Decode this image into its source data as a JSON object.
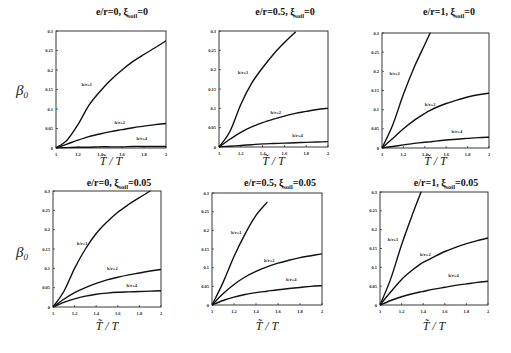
{
  "figure": {
    "y_axis_label": "β",
    "y_axis_label_sub": "0",
    "x_axis_label": "T̃ / T"
  },
  "chart_data": [
    {
      "type": "line",
      "title": "e/r=0, ξsoil=0",
      "title_parts": {
        "prefix": "e/r=0, ξ",
        "sub": "soil",
        "suffix": "=0"
      },
      "xlabel": "T̃ / T",
      "ylabel": "β0",
      "xlim": [
        1,
        2
      ],
      "ylim": [
        0,
        0.3
      ],
      "xticks": [
        "1",
        "1.2",
        "1.4",
        "1.6",
        "1.8",
        "2"
      ],
      "yticks": [
        "0",
        "0.05",
        "0.1",
        "0.15",
        "0.2",
        "0.25",
        "0.3"
      ],
      "grid": false,
      "x": [
        1,
        1.1,
        1.2,
        1.3,
        1.4,
        1.5,
        1.6,
        1.7,
        1.8,
        1.9,
        2
      ],
      "series": [
        {
          "name": "h/r=1",
          "label_at": [
            1.28,
            0.16
          ],
          "values": [
            0,
            0.02,
            0.06,
            0.11,
            0.145,
            0.175,
            0.2,
            0.222,
            0.24,
            0.257,
            0.275
          ]
        },
        {
          "name": "h/r=2",
          "label_at": [
            1.58,
            0.062
          ],
          "values": [
            0,
            0.01,
            0.02,
            0.029,
            0.036,
            0.042,
            0.047,
            0.052,
            0.056,
            0.06,
            0.063
          ]
        },
        {
          "name": "h/r=4",
          "label_at": [
            1.78,
            0.02
          ],
          "values": [
            0,
            0.001,
            0.002,
            0.002,
            0.003,
            0.003,
            0.003,
            0.004,
            0.004,
            0.004,
            0.004
          ]
        }
      ]
    },
    {
      "type": "line",
      "title": "e/r=0.5, ξsoil=0",
      "title_parts": {
        "prefix": "e/r=0.5, ξ",
        "sub": "soil",
        "suffix": "=0"
      },
      "xlabel": "T̃ / T",
      "ylabel": "",
      "xlim": [
        1,
        2
      ],
      "ylim": [
        0,
        0.3
      ],
      "xticks": [
        "1",
        "1.2",
        "1.4",
        "1.6",
        "1.8",
        "2"
      ],
      "yticks": [
        "0",
        "0.05",
        "0.1",
        "0.15",
        "0.2",
        "0.25",
        "0.3"
      ],
      "grid": false,
      "x": [
        1,
        1.1,
        1.2,
        1.3,
        1.4,
        1.5,
        1.6,
        1.7,
        1.8,
        1.9,
        2
      ],
      "series": [
        {
          "name": "h/r=1",
          "label_at": [
            1.22,
            0.19
          ],
          "values": [
            0,
            0.04,
            0.11,
            0.165,
            0.205,
            0.24,
            0.27,
            0.297,
            0.3,
            0.3,
            0.3
          ],
          "x_clip": 1.72
        },
        {
          "name": "h/r=2",
          "label_at": [
            1.52,
            0.085
          ],
          "values": [
            0,
            0.02,
            0.038,
            0.052,
            0.063,
            0.072,
            0.08,
            0.087,
            0.092,
            0.097,
            0.1
          ]
        },
        {
          "name": "h/r=4",
          "label_at": [
            1.72,
            0.025
          ],
          "values": [
            0,
            0.002,
            0.004,
            0.006,
            0.008,
            0.009,
            0.01,
            0.011,
            0.012,
            0.013,
            0.014
          ]
        }
      ]
    },
    {
      "type": "line",
      "title": "e/r=1, ξsoil=0",
      "title_parts": {
        "prefix": "e/r=1, ξ",
        "sub": "soil",
        "suffix": "=0"
      },
      "xlabel": "T̃ / T",
      "ylabel": "",
      "xlim": [
        1,
        2
      ],
      "ylim": [
        0,
        0.3
      ],
      "xticks": [
        "1",
        "1.2",
        "1.4",
        "1.6",
        "1.8",
        "2"
      ],
      "yticks": [
        "0",
        "0.05",
        "0.1",
        "0.15",
        "0.2",
        "0.25",
        "0.3"
      ],
      "grid": false,
      "x": [
        1,
        1.1,
        1.2,
        1.3,
        1.4,
        1.45,
        1.5,
        1.6,
        1.7,
        1.8,
        1.9,
        2
      ],
      "series": [
        {
          "name": "h/r=1",
          "label_at": [
            1.12,
            0.19
          ],
          "values": [
            0,
            0.06,
            0.14,
            0.21,
            0.27,
            0.3,
            0.3,
            0.3,
            0.3,
            0.3,
            0.3,
            0.3
          ],
          "x_clip": 1.45
        },
        {
          "name": "h/r=2",
          "label_at": [
            1.45,
            0.11
          ],
          "values": [
            0,
            0.025,
            0.05,
            0.072,
            0.09,
            0.098,
            0.105,
            0.116,
            0.125,
            0.133,
            0.139,
            0.143
          ]
        },
        {
          "name": "h/r=4",
          "label_at": [
            1.7,
            0.04
          ],
          "values": [
            0,
            0.004,
            0.008,
            0.012,
            0.015,
            0.016,
            0.018,
            0.021,
            0.023,
            0.025,
            0.027,
            0.028
          ]
        }
      ]
    },
    {
      "type": "line",
      "title": "e/r=0, ξsoil=0.05",
      "title_parts": {
        "prefix": "e/r=0, ξ",
        "sub": "soil",
        "suffix": "=0.05"
      },
      "xlabel": "T̃ / T",
      "ylabel": "β0",
      "xlim": [
        1,
        2
      ],
      "ylim": [
        0,
        0.3
      ],
      "xticks": [
        "1",
        "1.2",
        "1.4",
        "1.6",
        "1.8",
        "2"
      ],
      "yticks": [
        "0",
        "0.05",
        "0.1",
        "0.15",
        "0.2",
        "0.25",
        "0.3"
      ],
      "grid": false,
      "x": [
        1,
        1.1,
        1.2,
        1.3,
        1.4,
        1.5,
        1.6,
        1.7,
        1.8,
        1.9,
        2
      ],
      "series": [
        {
          "name": "h/r=1",
          "label_at": [
            1.27,
            0.16
          ],
          "values": [
            0,
            0.04,
            0.1,
            0.15,
            0.19,
            0.22,
            0.245,
            0.265,
            0.283,
            0.3,
            0.3
          ],
          "x_clip": 1.9
        },
        {
          "name": "h/r=2",
          "label_at": [
            1.55,
            0.095
          ],
          "values": [
            0,
            0.02,
            0.037,
            0.05,
            0.061,
            0.07,
            0.077,
            0.083,
            0.088,
            0.093,
            0.097
          ]
        },
        {
          "name": "h/r=4",
          "label_at": [
            1.73,
            0.052
          ],
          "values": [
            0,
            0.012,
            0.021,
            0.028,
            0.033,
            0.036,
            0.038,
            0.039,
            0.04,
            0.041,
            0.042
          ]
        }
      ]
    },
    {
      "type": "line",
      "title": "e/r=0.5, ξsoil=0.05",
      "title_parts": {
        "prefix": "e/r=0.5, ξ",
        "sub": "soil",
        "suffix": "=0.05"
      },
      "xlabel": "T̃ / T",
      "ylabel": "",
      "xlim": [
        1,
        2
      ],
      "ylim": [
        0,
        0.3
      ],
      "xticks": [
        "1",
        "1.2",
        "1.4",
        "1.6",
        "1.8",
        "2"
      ],
      "yticks": [
        "0",
        "0.05",
        "0.1",
        "0.15",
        "0.2",
        "0.25",
        "0.3"
      ],
      "grid": false,
      "x": [
        1,
        1.1,
        1.2,
        1.3,
        1.4,
        1.5,
        1.6,
        1.7,
        1.8,
        1.9,
        2
      ],
      "series": [
        {
          "name": "h/r=1",
          "label_at": [
            1.22,
            0.19
          ],
          "values": [
            0,
            0.06,
            0.13,
            0.19,
            0.24,
            0.275,
            0.3,
            0.3,
            0.3,
            0.3,
            0.3
          ],
          "x_clip": 1.58
        },
        {
          "name": "h/r=2",
          "label_at": [
            1.52,
            0.115
          ],
          "values": [
            0,
            0.03,
            0.055,
            0.075,
            0.09,
            0.102,
            0.112,
            0.12,
            0.127,
            0.132,
            0.137
          ]
        },
        {
          "name": "h/r=4",
          "label_at": [
            1.72,
            0.065
          ],
          "values": [
            0,
            0.012,
            0.021,
            0.028,
            0.033,
            0.037,
            0.041,
            0.044,
            0.047,
            0.05,
            0.052
          ]
        }
      ]
    },
    {
      "type": "line",
      "title": "e/r=1, ξsoil=0.05",
      "title_parts": {
        "prefix": "e/r=1, ξ",
        "sub": "soil",
        "suffix": "=0.05"
      },
      "xlabel": "T̃ / T",
      "ylabel": "",
      "xlim": [
        1,
        2
      ],
      "ylim": [
        0,
        0.3
      ],
      "xticks": [
        "1",
        "1.2",
        "1.4",
        "1.6",
        "1.8",
        "2"
      ],
      "yticks": [
        "0",
        "0.05",
        "0.1",
        "0.15",
        "0.2",
        "0.25",
        "0.3"
      ],
      "grid": false,
      "x": [
        1,
        1.1,
        1.2,
        1.3,
        1.38,
        1.4,
        1.5,
        1.6,
        1.7,
        1.8,
        1.9,
        2
      ],
      "series": [
        {
          "name": "h/r=1",
          "label_at": [
            1.12,
            0.17
          ],
          "values": [
            0,
            0.07,
            0.16,
            0.24,
            0.3,
            0.3,
            0.3,
            0.3,
            0.3,
            0.3,
            0.3,
            0.3
          ],
          "x_clip": 1.38
        },
        {
          "name": "h/r=2",
          "label_at": [
            1.42,
            0.13
          ],
          "values": [
            0,
            0.035,
            0.068,
            0.093,
            0.11,
            0.113,
            0.128,
            0.142,
            0.153,
            0.163,
            0.171,
            0.178
          ]
        },
        {
          "name": "h/r=4",
          "label_at": [
            1.68,
            0.075
          ],
          "values": [
            0,
            0.012,
            0.022,
            0.03,
            0.035,
            0.036,
            0.042,
            0.047,
            0.052,
            0.056,
            0.06,
            0.063
          ]
        }
      ]
    }
  ]
}
